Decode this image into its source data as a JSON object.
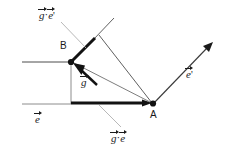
{
  "figure": {
    "background": "#ffffff",
    "stroke_dark": "#1a1a1a",
    "stroke_light": "#8c8c8c",
    "width": 232,
    "height": 151
  },
  "points": [
    {
      "id": "A",
      "label": "A",
      "x": 153,
      "y": 104
    },
    {
      "id": "B",
      "label": "B",
      "x": 71,
      "y": 62
    }
  ],
  "labels": {
    "point_a": "A",
    "point_b": "B",
    "vector_g": "g",
    "vector_e": "e",
    "vector_e_prime": "e'",
    "proj_g_e": "g·e",
    "proj_g_e_prime": "g·e'",
    "dot": "·",
    "prime_mark": "'"
  },
  "annotations": [
    {
      "name": "proj-g-e-prime-label",
      "text_base": "g",
      "text_dot": "·",
      "text_second": "e",
      "prime": true,
      "x": 39,
      "y": 9
    },
    {
      "name": "vector-g-label",
      "text_base": "g",
      "prime": false,
      "x": 82,
      "y": 76
    },
    {
      "name": "vector-e-label",
      "text_base": "e",
      "prime": false,
      "x": 35,
      "y": 113
    },
    {
      "name": "proj-g-e-label",
      "text_base": "g",
      "text_dot": "·",
      "text_second": "e",
      "prime": false,
      "x": 113,
      "y": 132
    },
    {
      "name": "vector-e-prime-label",
      "text_base": "e",
      "prime": true,
      "x": 188,
      "y": 68
    }
  ],
  "geometry": {
    "axis_e_line": {
      "x1": 22,
      "y1": 104,
      "x2": 71,
      "y2": 104
    },
    "axis_e_prime_from_b": {
      "x1": 22,
      "y1": 62,
      "x2": 71,
      "y2": 62
    },
    "vertical_drop": {
      "x1": 71,
      "y1": 62,
      "x2": 71,
      "y2": 104
    },
    "thick_proj_e": {
      "x1": 71,
      "y1": 103,
      "x2": 151,
      "y2": 103
    },
    "thick_proj_e_prime": {
      "x1": 71,
      "y1": 62,
      "x2": 95,
      "y2": 38
    },
    "thin_ray_upper": {
      "x1": 95,
      "y1": 38,
      "x2": 112,
      "y2": 19
    },
    "vector_g_arrow": {
      "x1": 100,
      "y1": 88,
      "x2": 73,
      "y2": 64
    },
    "thin_a_to_b": {
      "x1": 151,
      "y1": 103,
      "x2": 71,
      "y2": 62
    },
    "thin_a_to_upper": {
      "x1": 151,
      "y1": 103,
      "x2": 97,
      "y2": 36
    },
    "vector_e_prime_arrow": {
      "x1": 153,
      "y1": 104,
      "x2": 212,
      "y2": 43
    },
    "leader_top": {
      "x1": 60,
      "y1": 20,
      "x2": 85,
      "y2": 47
    },
    "leader_bottom": {
      "x1": 122,
      "y1": 126,
      "x2": 98,
      "y2": 104
    }
  }
}
